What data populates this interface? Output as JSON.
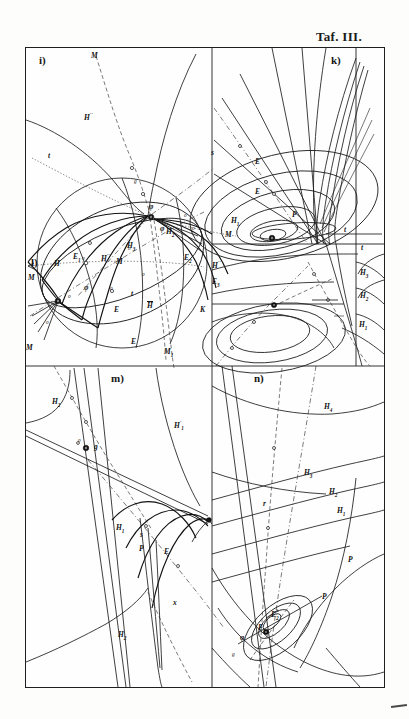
{
  "plate": {
    "title": "Taf. III.",
    "background_color": "#fdfdfc",
    "ink_color": "#1a1a1a",
    "frame": {
      "x": 25,
      "y": 47,
      "width": 360,
      "height": 641
    }
  },
  "panels": [
    {
      "id": "i",
      "caption": "i)"
    },
    {
      "id": "k",
      "caption": "k)"
    },
    {
      "id": "l",
      "caption": "l)"
    },
    {
      "id": "m",
      "caption": "m)"
    },
    {
      "id": "n",
      "caption": "n)"
    }
  ],
  "labels": {
    "panel_i": {
      "M_top": "M",
      "H_upper": "H",
      "H_upper_sup": "''",
      "t_left": "t",
      "s_right": "s",
      "node_phi": "φ",
      "M_right": "M",
      "E_left": "E",
      "E_left_sub": "1",
      "H_mid": "H",
      "H_mid_sup": "''",
      "E_right": "E",
      "E_right_sub": "2",
      "H_right": "H",
      "H_right_sup": "''",
      "E_right2": "E",
      "E_right2_sub": "3",
      "K_right": "K",
      "M_left": "M",
      "M_bottom": "M",
      "M_bottom_sub": "1",
      "node_g": "g",
      "small_o_1": "o",
      "small_o_2": "o",
      "small_o_3": "o",
      "small_o_4": "o"
    },
    "panel_k": {
      "E_outer": "E",
      "E_inner": "E",
      "P": "P",
      "H1": "H",
      "H1_sub": "1",
      "H2": "H",
      "H2_sub": "2",
      "H3": "H",
      "H3_sub": "3",
      "phi": "φ",
      "t": "t",
      "o_1": "o",
      "o_2": "o"
    },
    "panel_l": {
      "H": "H",
      "M_upper": "M",
      "M_lower": "M",
      "t": "t",
      "phi": "φ",
      "E_outer": "E",
      "E_inner": "E",
      "H_bar": "H",
      "H1": "H",
      "H1_sub": "1",
      "H2": "H",
      "H2_sub": "2",
      "H3": "H",
      "H3_sub": "3",
      "o_1": "o",
      "o_2": "o",
      "o_3": "o",
      "o_4": "o"
    },
    "panel_m": {
      "H2": "H",
      "H2_sub": "2",
      "H1prime": "H",
      "H1prime_sup": "'",
      "H1prime_sub": "1",
      "H1": "H",
      "H1_sub": "1",
      "P": "P",
      "E": "E",
      "g": "g",
      "o": "o",
      "s": "s",
      "H_bottom": "H",
      "H_bottom_sub": "2",
      "x": "x"
    },
    "panel_n": {
      "H4": "H",
      "H4_sub": "4",
      "H3": "H",
      "H3_sub": "3",
      "H2": "H",
      "H2_sub": "2",
      "H1": "H",
      "H1_sub": "1",
      "r": "r",
      "P": "P",
      "P_upper": "P",
      "E2": "E",
      "E2_sub": "2",
      "E1": "E",
      "E1_sub": "1",
      "phi": "φ",
      "g": "g"
    }
  }
}
